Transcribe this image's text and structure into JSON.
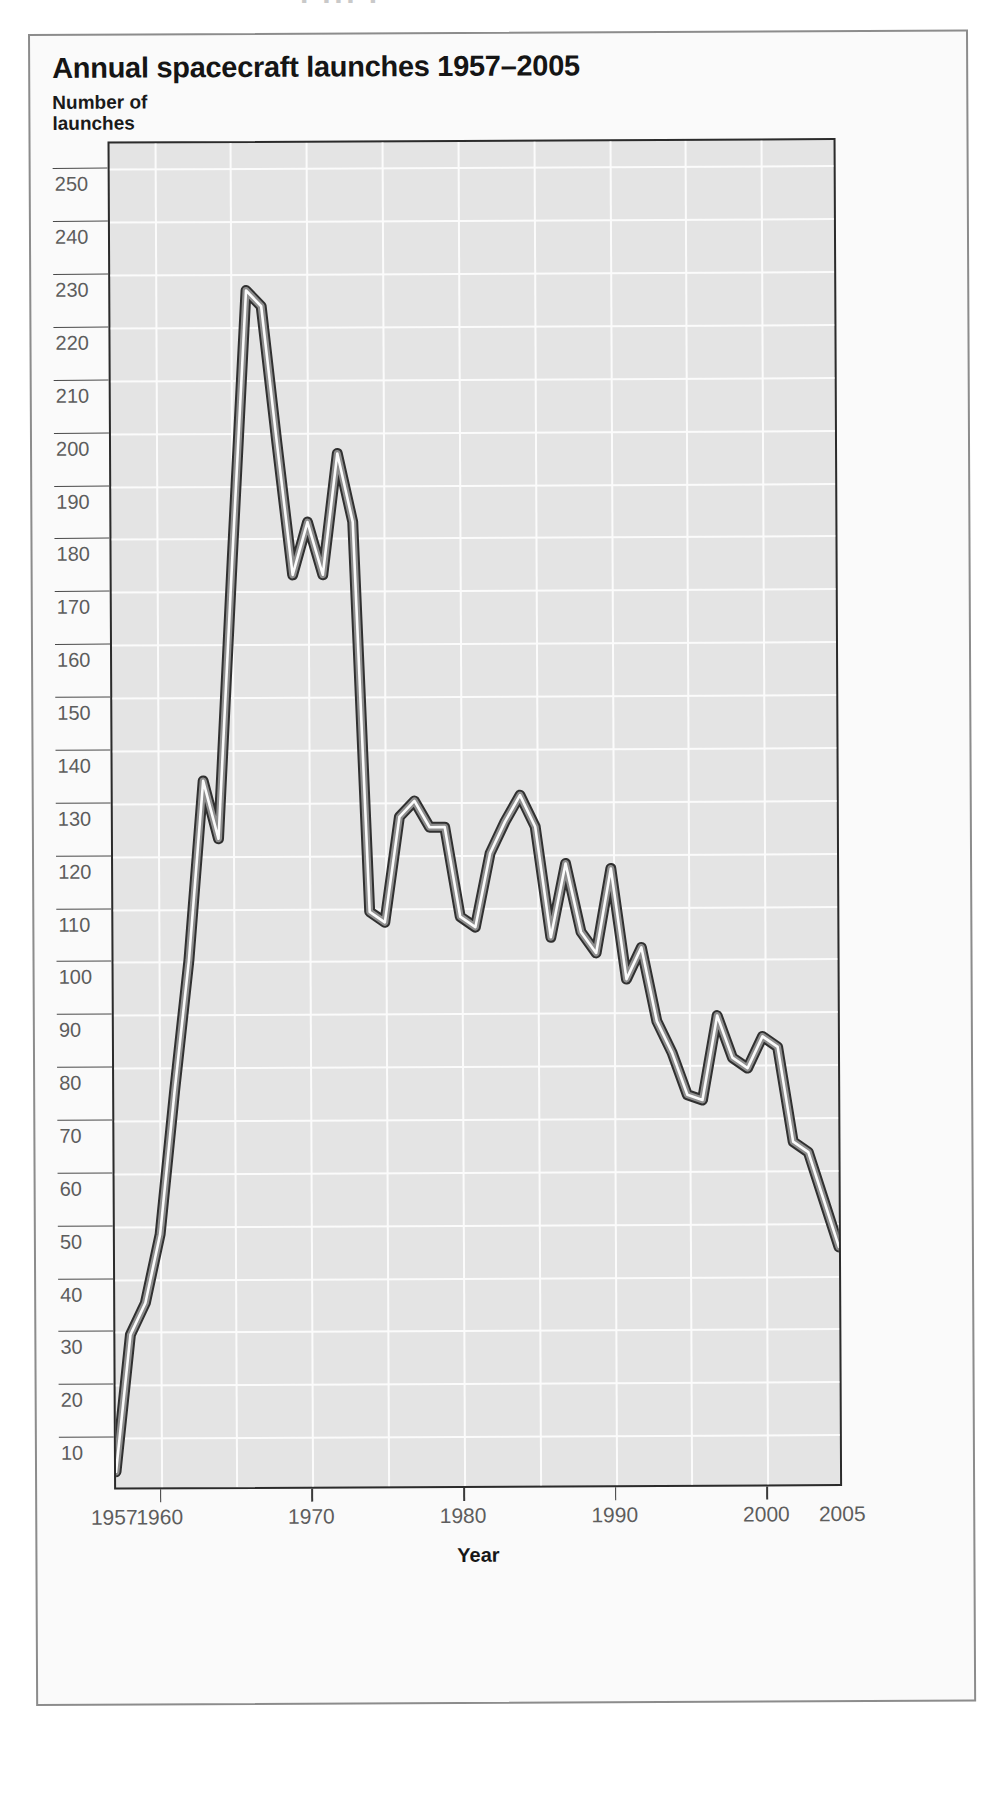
{
  "page": {
    "top_remnant_text": "· ··· ·"
  },
  "figure": {
    "title": "Annual spacecraft launches 1957–2005",
    "y_axis_title": "Number of\nlaunches",
    "x_axis_title": "Year",
    "colors": {
      "plot_background": "#e4e4e4",
      "gridline": "#fbfbfb",
      "axis": "#2b2b2b",
      "line_dark": "#3a3a3a",
      "line_highlight": "#fdfdfd",
      "tick_label": "#5d5d5d",
      "panel_background": "#fafafa",
      "panel_border": "#8c8c8c"
    }
  },
  "chart_data": {
    "type": "line",
    "title": "Annual spacecraft launches 1957–2005",
    "xlabel": "Year",
    "ylabel": "Number of launches",
    "xlim": [
      1957,
      2005
    ],
    "ylim": [
      0,
      255
    ],
    "grid": true,
    "legend": "none",
    "y_ticks": [
      250,
      240,
      230,
      220,
      210,
      200,
      190,
      180,
      170,
      160,
      150,
      140,
      130,
      120,
      110,
      100,
      90,
      80,
      70,
      60,
      50,
      40,
      30,
      20,
      10
    ],
    "x_ticks": [
      1957,
      1960,
      1970,
      1980,
      1990,
      2000,
      2005
    ],
    "x_gridlines": [
      1960,
      1965,
      1970,
      1975,
      1980,
      1985,
      1990,
      1995,
      2000,
      2005
    ],
    "y_gridline_step": 10,
    "x": [
      1957,
      1958,
      1959,
      1960,
      1961,
      1962,
      1963,
      1964,
      1965,
      1966,
      1967,
      1968,
      1969,
      1970,
      1971,
      1972,
      1973,
      1974,
      1975,
      1976,
      1977,
      1978,
      1979,
      1980,
      1981,
      1982,
      1983,
      1984,
      1985,
      1986,
      1987,
      1988,
      1989,
      1990,
      1991,
      1992,
      1993,
      1994,
      1995,
      1996,
      1997,
      1998,
      1999,
      2000,
      2001,
      2002,
      2003,
      2004,
      2005
    ],
    "values": [
      3,
      29,
      35,
      48,
      75,
      100,
      134,
      123,
      176,
      227,
      224,
      198,
      173,
      183,
      173,
      196,
      183,
      109,
      107,
      127,
      130,
      125,
      125,
      108,
      106,
      120,
      126,
      131,
      125,
      104,
      118,
      105,
      101,
      117,
      96,
      102,
      88,
      82,
      74,
      73,
      89,
      81,
      79,
      85,
      83,
      65,
      63,
      54,
      45
    ],
    "annotations": {
      "peak_year": 1966,
      "peak_value": 227,
      "final_year": 2005,
      "final_value": 45
    }
  }
}
